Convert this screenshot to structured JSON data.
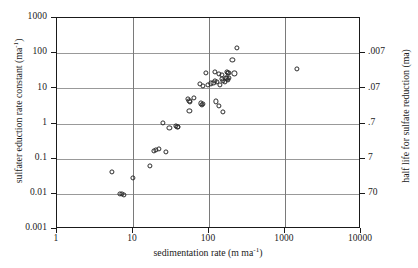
{
  "figure": {
    "axis_titles": {
      "y_left": "sulfater eduction rate constant (ma",
      "y_left_sup": "-1",
      "y_left_tail": ")",
      "y_right": "half life for sulfate reduction (ma)",
      "x": "sedimentation rate (m ma",
      "x_sup": "-1",
      "x_tail": ")"
    },
    "colors": {
      "frame": "#1a1a1a",
      "gridline_horizontal": "#999999",
      "gridline_vertical": "#7a7a7a",
      "marker_stroke": "#2a2a2a",
      "background": "#ffffff"
    }
  },
  "chart_data": {
    "type": "scatter",
    "title": "",
    "xlabel": "sedimentation rate (m ma^-1)",
    "ylabel": "sulfate reduction rate constant (ma^-1)",
    "y2label": "half life for sulfate reduction (ma)",
    "xscale": "log",
    "yscale": "log",
    "xlim": [
      1,
      10000
    ],
    "ylim": [
      0.001,
      1000
    ],
    "y2lim": [
      0.0007,
      700
    ],
    "y2_reversed": true,
    "grid": true,
    "legend": "none",
    "xticks": [
      1,
      10,
      100,
      1000,
      10000
    ],
    "xticklabels": [
      "1",
      "10",
      "100",
      "1000",
      "10000"
    ],
    "yticks": [
      0.001,
      0.01,
      0.1,
      1,
      10,
      100,
      1000
    ],
    "yticklabels": [
      "0.001",
      "0.01",
      "0.1",
      "1",
      "10",
      "100",
      "1000"
    ],
    "y2ticks": [
      0.007,
      0.07,
      0.7,
      7,
      70
    ],
    "y2ticklabels": [
      ".007",
      ".07",
      ".7",
      "7",
      "70"
    ],
    "n_points": 52,
    "points": [
      {
        "x": 5.4,
        "y": 0.04
      },
      {
        "x": 6.9,
        "y": 0.0095
      },
      {
        "x": 7.4,
        "y": 0.0092
      },
      {
        "x": 7.9,
        "y": 0.0086
      },
      {
        "x": 10.2,
        "y": 0.027
      },
      {
        "x": 17.4,
        "y": 0.057
      },
      {
        "x": 19.5,
        "y": 0.155
      },
      {
        "x": 20.8,
        "y": 0.162
      },
      {
        "x": 22.6,
        "y": 0.175
      },
      {
        "x": 28.0,
        "y": 0.148
      },
      {
        "x": 25.5,
        "y": 0.95
      },
      {
        "x": 31.0,
        "y": 0.72
      },
      {
        "x": 37.5,
        "y": 0.8
      },
      {
        "x": 39.5,
        "y": 0.76
      },
      {
        "x": 40.5,
        "y": 0.74
      },
      {
        "x": 55.0,
        "y": 4.6
      },
      {
        "x": 57.0,
        "y": 4.2
      },
      {
        "x": 58.0,
        "y": 3.9
      },
      {
        "x": 66.0,
        "y": 5.0
      },
      {
        "x": 57.0,
        "y": 2.1
      },
      {
        "x": 80.0,
        "y": 3.5
      },
      {
        "x": 86.0,
        "y": 3.4
      },
      {
        "x": 84.0,
        "y": 3.2
      },
      {
        "x": 78.0,
        "y": 12.5
      },
      {
        "x": 86.0,
        "y": 11.0
      },
      {
        "x": 99.0,
        "y": 12.0
      },
      {
        "x": 108.0,
        "y": 13.0
      },
      {
        "x": 118.0,
        "y": 13.5
      },
      {
        "x": 124.0,
        "y": 15.5
      },
      {
        "x": 131.0,
        "y": 14.0
      },
      {
        "x": 144.0,
        "y": 12.0
      },
      {
        "x": 152.0,
        "y": 17.0
      },
      {
        "x": 158.0,
        "y": 15.0
      },
      {
        "x": 166.0,
        "y": 14.5
      },
      {
        "x": 172.0,
        "y": 19.0
      },
      {
        "x": 176.0,
        "y": 18.0
      },
      {
        "x": 183.0,
        "y": 16.5
      },
      {
        "x": 190.0,
        "y": 18.5
      },
      {
        "x": 94.0,
        "y": 26.0
      },
      {
        "x": 122.0,
        "y": 27.0
      },
      {
        "x": 138.0,
        "y": 24.0
      },
      {
        "x": 152.0,
        "y": 23.0
      },
      {
        "x": 177.0,
        "y": 27.0
      },
      {
        "x": 183.0,
        "y": 26.0
      },
      {
        "x": 186.0,
        "y": 25.5
      },
      {
        "x": 222.0,
        "y": 25.0
      },
      {
        "x": 126.0,
        "y": 4.0
      },
      {
        "x": 140.0,
        "y": 3.0
      },
      {
        "x": 158.0,
        "y": 2.0
      },
      {
        "x": 210.0,
        "y": 60.0
      },
      {
        "x": 238.0,
        "y": 135.0
      },
      {
        "x": 1480.0,
        "y": 33.0
      }
    ]
  }
}
